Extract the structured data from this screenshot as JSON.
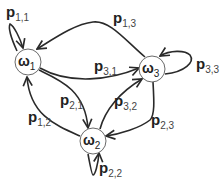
{
  "diagram": {
    "type": "markov-chain-state-transition",
    "nodes": [
      {
        "id": "w1",
        "symbol": "ω",
        "index": "1"
      },
      {
        "id": "w2",
        "symbol": "ω",
        "index": "2"
      },
      {
        "id": "w3",
        "symbol": "ω",
        "index": "3"
      }
    ],
    "edges": [
      {
        "from": "w1",
        "to": "w1",
        "symbol": "p",
        "index": "1,1"
      },
      {
        "from": "w3",
        "to": "w1",
        "symbol": "p",
        "index": "1,3"
      },
      {
        "from": "w1",
        "to": "w3",
        "symbol": "p",
        "index": "3,1"
      },
      {
        "from": "w1",
        "to": "w2",
        "symbol": "p",
        "index": "2,1"
      },
      {
        "from": "w2",
        "to": "w1",
        "symbol": "p",
        "index": "1,2"
      },
      {
        "from": "w2",
        "to": "w3",
        "symbol": "p",
        "index": "3,2"
      },
      {
        "from": "w3",
        "to": "w2",
        "symbol": "p",
        "index": "2,3"
      },
      {
        "from": "w3",
        "to": "w3",
        "symbol": "p",
        "index": "3,3"
      },
      {
        "from": "w2",
        "to": "w2",
        "symbol": "p",
        "index": "2,2"
      }
    ],
    "colors": {
      "edge": "#2a2a2a",
      "node_border": "#6a6a6a",
      "text": "#222222"
    }
  }
}
